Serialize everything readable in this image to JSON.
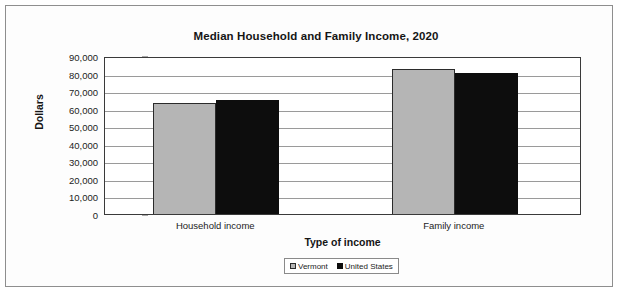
{
  "chart_data": {
    "type": "bar",
    "title": "Median Household and Family Income, 2020",
    "xlabel": "Type of income",
    "ylabel": "Dollars",
    "categories": [
      "Household income",
      "Family income"
    ],
    "series": [
      {
        "name": "Vermont",
        "color": "#b5b5b5",
        "values": [
          63001,
          82465
        ]
      },
      {
        "name": "United States",
        "color": "#0d0d0d",
        "values": [
          64994,
          80069
        ]
      }
    ],
    "ylim": [
      0,
      90000
    ],
    "ytick_step": 10000,
    "ytick_labels": [
      "90,000",
      "80,000",
      "70,000",
      "60,000",
      "50,000",
      "40,000",
      "30,000",
      "20,000",
      "10,000",
      "0"
    ],
    "ytick_values": [
      90000,
      80000,
      70000,
      60000,
      50000,
      40000,
      30000,
      20000,
      10000,
      0
    ],
    "grid": true,
    "legend_position": "bottom"
  }
}
